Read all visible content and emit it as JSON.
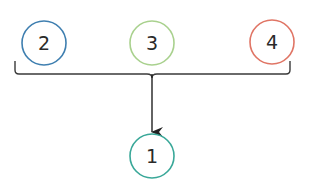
{
  "diagram": {
    "type": "grouping-arrow",
    "sources": [
      {
        "id": "node-2",
        "label": "2",
        "cx": 44,
        "cy": 43,
        "r": 22,
        "color": "#3f7fb0"
      },
      {
        "id": "node-3",
        "label": "3",
        "cx": 152,
        "cy": 43,
        "r": 22,
        "color": "#a9d18e"
      },
      {
        "id": "node-4",
        "label": "4",
        "cx": 272,
        "cy": 42,
        "r": 22,
        "color": "#e07565"
      }
    ],
    "target": {
      "id": "node-1",
      "label": "1",
      "cx": 152,
      "cy": 156,
      "r": 22,
      "color": "#3aa899"
    },
    "bracket": {
      "x_left": 15,
      "x_right": 290,
      "y_top": 61,
      "y_bottom": 74,
      "tip_x": 152,
      "color": "#3a3a3a"
    },
    "arrow": {
      "x": 152,
      "y_start": 74,
      "y_end": 132,
      "color": "#222222"
    }
  }
}
